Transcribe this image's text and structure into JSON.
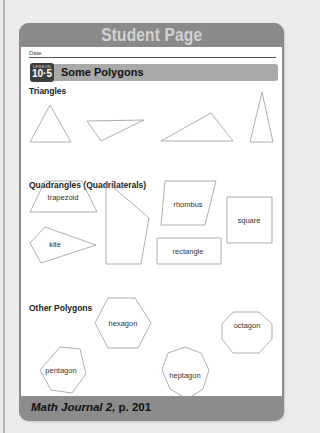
{
  "header": {
    "title": "Student Page"
  },
  "date_label": "Date",
  "lesson": {
    "badge_small": "LESSON",
    "number": "10·5",
    "title": "Some Polygons"
  },
  "sections": {
    "triangles": "Triangles",
    "quadrangles": "Quadrangles (Quadrilaterals)",
    "other": "Other Polygons"
  },
  "shapes": {
    "stroke": "#9a9a9a",
    "triangles": [
      "30,142 50,105 71,142",
      "87,121 144,120 101,141",
      "161,141 211,113 233,141",
      "250,142 262,92 273,142"
    ],
    "quadrangles": [
      {
        "label": "trapezoid",
        "points": "30,212 45,181 82,181 97,212",
        "lx": 63,
        "ly": 197
      },
      {
        "label": "",
        "points": "106,181 149,218 141,264 106,264",
        "lx": 0,
        "ly": 0
      },
      {
        "label": "rhombus",
        "points": "165,181 216,181 205,225 161,225",
        "lx": 188,
        "ly": 204
      },
      {
        "label": "square",
        "points": "227,197 272,197 272,243 227,243",
        "lx": 249,
        "ly": 220
      },
      {
        "label": "kite",
        "points": "30,243 45,227 96,245 41,263",
        "lx": 55,
        "ly": 244
      },
      {
        "label": "rectangle",
        "points": "157,238 221,238 221,264 157,264",
        "lx": 188,
        "ly": 251
      }
    ],
    "polygons": [
      {
        "label": "hexagon",
        "points": "95,323 108,298 135,298 151,323 138,348 108,348",
        "lx": 123,
        "ly": 323
      },
      {
        "label": "octagon",
        "points": "222,324 233,312 259,312 272,324 272,339 259,353 233,353 222,339",
        "lx": 247,
        "ly": 325
      },
      {
        "label": "pentagon",
        "points": "60,347 80,349 86,374 72,393 51,390 40,370",
        "lx": 61,
        "ly": 370
      },
      {
        "label": "heptagon",
        "points": "185,347 201,353 209,370 203,389 187,399 170,389 162,370 168,353",
        "lx": 185,
        "ly": 375
      }
    ]
  },
  "footer": {
    "journal": "Math Journal 2,",
    "page": " p. 201"
  }
}
